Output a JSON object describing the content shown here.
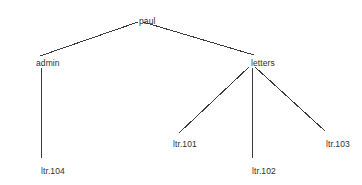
{
  "diagram": {
    "type": "tree",
    "title": "",
    "background_color": "#ffffff",
    "line_color": "#3b3b3b",
    "text_color": "#2e2e2e",
    "nodes": [
      {
        "id": "paul",
        "label": "paul",
        "x": 139,
        "y": 16,
        "level": 0,
        "parent": null
      },
      {
        "id": "admin",
        "label": "admin",
        "x": 36,
        "y": 58,
        "level": 1,
        "parent": "paul"
      },
      {
        "id": "letters",
        "label": "letters",
        "x": 251,
        "y": 58,
        "level": 1,
        "parent": "paul"
      },
      {
        "id": "ltr104",
        "label": "ltr.104",
        "x": 41,
        "y": 166,
        "level": 2,
        "parent": "admin"
      },
      {
        "id": "ltr101",
        "label": "ltr.101",
        "x": 173,
        "y": 139,
        "level": 2,
        "parent": "letters"
      },
      {
        "id": "ltr102",
        "label": "ltr.102",
        "x": 252,
        "y": 166,
        "level": 2,
        "parent": "letters"
      },
      {
        "id": "ltr103",
        "label": "ltr.103",
        "x": 326,
        "y": 139,
        "level": 2,
        "parent": "letters"
      }
    ],
    "edges": [
      {
        "id": "paul-admin",
        "from": "paul",
        "to": "admin",
        "x1": 138,
        "y1": 22,
        "x2": 40,
        "y2": 56
      },
      {
        "id": "paul-letters",
        "from": "paul",
        "to": "letters",
        "x1": 143,
        "y1": 22,
        "x2": 254,
        "y2": 55
      },
      {
        "id": "admin-ltr104",
        "from": "admin",
        "to": "ltr104",
        "x1": 41,
        "y1": 68,
        "x2": 41,
        "y2": 158
      },
      {
        "id": "letters-ltr101",
        "from": "letters",
        "to": "ltr101",
        "x1": 249,
        "y1": 67,
        "x2": 179,
        "y2": 133
      },
      {
        "id": "letters-ltr102",
        "from": "letters",
        "to": "ltr102",
        "x1": 252,
        "y1": 68,
        "x2": 252,
        "y2": 158
      },
      {
        "id": "letters-ltr103",
        "from": "letters",
        "to": "ltr103",
        "x1": 255,
        "y1": 67,
        "x2": 325,
        "y2": 131
      }
    ]
  }
}
